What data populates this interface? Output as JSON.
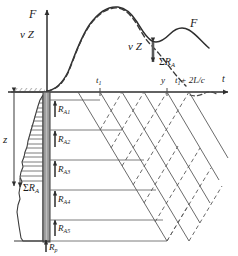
{
  "figure": {
    "axes": {
      "vertical_label_force": "F",
      "vertical_label_velocity": "v Z",
      "horizontal_label_time": "t",
      "depth_label": "z"
    },
    "curve_labels": {
      "force_curve": "F",
      "velocity_curve": "v Z",
      "separation_upper": "ΣR",
      "separation_upper_sub": "A"
    },
    "time_ticks": [
      {
        "label": "t",
        "sub": "1",
        "x": 96,
        "y": 77
      },
      {
        "label": "y",
        "sub": "",
        "x": 163,
        "y": 78
      },
      {
        "label": "t",
        "sub": "1",
        "suffix": " + 2L/c",
        "x": 178,
        "y": 78
      }
    ],
    "tick_t1": "t",
    "tick_t1_sub": "1",
    "tick_y": "y",
    "tick_t2_main": "t",
    "tick_t2_sub": "1",
    "tick_t2_suffix": "+ 2L/c",
    "axis_t": "t",
    "resistances": [
      {
        "name": "R",
        "sub": "A1"
      },
      {
        "name": "R",
        "sub": "A2"
      },
      {
        "name": "R",
        "sub": "A3"
      },
      {
        "name": "R",
        "sub": "A4"
      },
      {
        "name": "R",
        "sub": "A5"
      }
    ],
    "toe_resistance": {
      "name": "R",
      "sub": "p"
    },
    "sum_resistance_lower": {
      "sigma": "Σ",
      "name": "R",
      "sub": "A"
    },
    "colors": {
      "line": "#3a3a3a",
      "pile_fill": "#9a9a9a",
      "pile_edge": "#4a4a4a",
      "text": "#1a1a1a",
      "thin_line": "#6e6e6e",
      "dashed": "#4a4a4a"
    }
  }
}
